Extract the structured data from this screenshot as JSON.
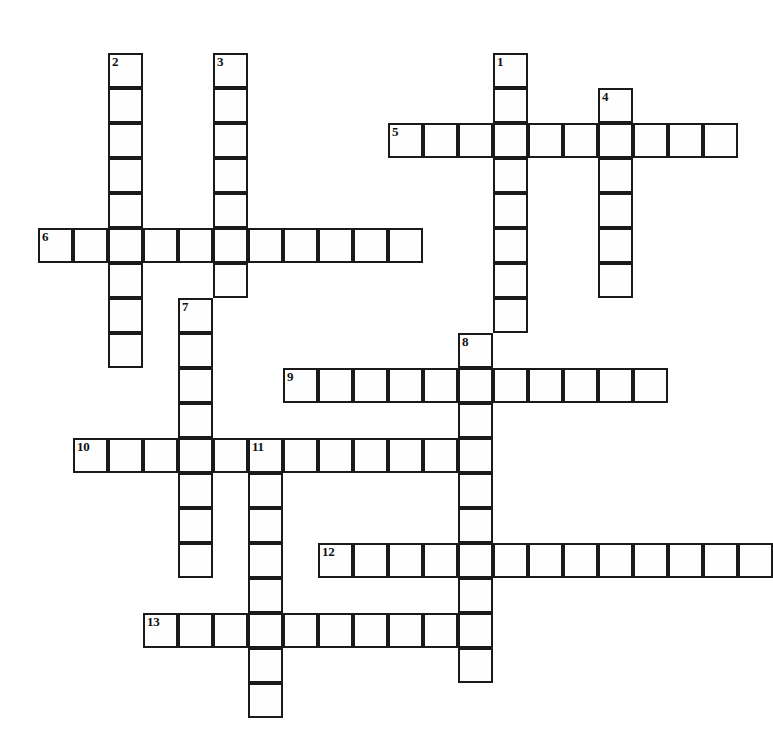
{
  "puzzle": {
    "title": "Crossword Puzzle Grid",
    "grid_origin_x": 38,
    "grid_origin_y": 53,
    "cell_size": 35,
    "cell_border_color": "#1a1a1a",
    "cell_fill_color": "#fefefe",
    "background_color": "#ffffff",
    "entries": [
      {
        "number": "1",
        "direction": "down",
        "col": 13,
        "row": 0,
        "length": 8
      },
      {
        "number": "2",
        "direction": "down",
        "col": 2,
        "row": 0,
        "length": 9
      },
      {
        "number": "3",
        "direction": "down",
        "col": 5,
        "row": 0,
        "length": 7
      },
      {
        "number": "4",
        "direction": "down",
        "col": 16,
        "row": 1,
        "length": 6
      },
      {
        "number": "5",
        "direction": "across",
        "col": 10,
        "row": 2,
        "length": 10
      },
      {
        "number": "6",
        "direction": "across",
        "col": 0,
        "row": 5,
        "length": 11
      },
      {
        "number": "7",
        "direction": "down",
        "col": 4,
        "row": 7,
        "length": 8
      },
      {
        "number": "8",
        "direction": "down",
        "col": 12,
        "row": 8,
        "length": 10
      },
      {
        "number": "9",
        "direction": "across",
        "col": 7,
        "row": 9,
        "length": 11
      },
      {
        "number": "10",
        "direction": "across",
        "col": 1,
        "row": 11,
        "length": 11
      },
      {
        "number": "11",
        "direction": "down",
        "col": 6,
        "row": 11,
        "length": 8
      },
      {
        "number": "12",
        "direction": "across",
        "col": 8,
        "row": 14,
        "length": 13
      },
      {
        "number": "13",
        "direction": "across",
        "col": 3,
        "row": 16,
        "length": 9
      }
    ],
    "numbers_visible": [
      "1",
      "2",
      "3",
      "4",
      "5",
      "6",
      "7",
      "8",
      "9",
      "10",
      "11",
      "12",
      "13"
    ]
  }
}
